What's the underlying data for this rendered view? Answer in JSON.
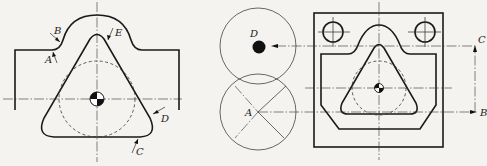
{
  "figure": {
    "left_view": {
      "labels": {
        "A": "A",
        "B": "B",
        "C": "C",
        "D": "D",
        "E": "E"
      }
    },
    "right_view": {
      "labels": {
        "A": "A",
        "B": "B",
        "C": "C",
        "D": "D"
      }
    }
  }
}
